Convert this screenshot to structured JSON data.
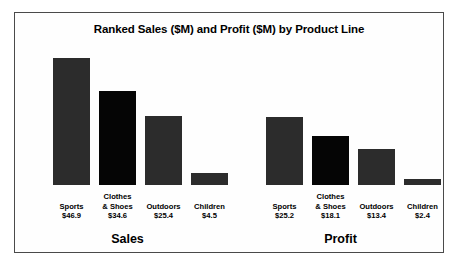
{
  "chart_data": {
    "type": "bar",
    "title": "Ranked Sales ($M) and Profit ($M) by Product Line",
    "xlabel": "",
    "ylabel": "",
    "grid": false,
    "legend": "none",
    "ylim": [
      0,
      50
    ],
    "categories": [
      "Sports",
      "Clothes & Shoes",
      "Outdoors",
      "Children"
    ],
    "series": [
      {
        "name": "Sales",
        "values": [
          46.9,
          34.6,
          25.4,
          4.5
        ],
        "value_labels": [
          "$46.9",
          "$34.6",
          "$25.4",
          "$4.5"
        ]
      },
      {
        "name": "Profit",
        "values": [
          25.2,
          18.1,
          13.4,
          2.4
        ],
        "value_labels": [
          "$25.2",
          "$18.1",
          "$13.4",
          "$2.4"
        ]
      }
    ]
  },
  "panels": [
    {
      "title": "Sales",
      "bars": [
        {
          "category": "Sports",
          "category_line1": "Sports",
          "category_line2": "",
          "value": 46.9,
          "value_label": "$46.9",
          "color": "#2c2c2c"
        },
        {
          "category": "Clothes & Shoes",
          "category_line1": "Clothes",
          "category_line2": "& Shoes",
          "value": 34.6,
          "value_label": "$34.6",
          "color": "#050505"
        },
        {
          "category": "Outdoors",
          "category_line1": "Outdoors",
          "category_line2": "",
          "value": 25.4,
          "value_label": "$25.4",
          "color": "#2c2c2c"
        },
        {
          "category": "Children",
          "category_line1": "Children",
          "category_line2": "",
          "value": 4.5,
          "value_label": "$4.5",
          "color": "#2c2c2c"
        }
      ]
    },
    {
      "title": "Profit",
      "bars": [
        {
          "category": "Sports",
          "category_line1": "Sports",
          "category_line2": "",
          "value": 25.2,
          "value_label": "$25.2",
          "color": "#2c2c2c"
        },
        {
          "category": "Clothes & Shoes",
          "category_line1": "Clothes",
          "category_line2": "& Shoes",
          "value": 18.1,
          "value_label": "$18.1",
          "color": "#050505"
        },
        {
          "category": "Outdoors",
          "category_line1": "Outdoors",
          "category_line2": "",
          "value": 13.4,
          "value_label": "$13.4",
          "color": "#2c2c2c"
        },
        {
          "category": "Children",
          "category_line1": "Children",
          "category_line2": "",
          "value": 2.4,
          "value_label": "$2.4",
          "color": "#2c2c2c"
        }
      ]
    }
  ],
  "render": {
    "px_per_unit": 2.705,
    "bar_pitch": 46,
    "bar_offset": 28,
    "frame_color": "#4a4a4a"
  }
}
